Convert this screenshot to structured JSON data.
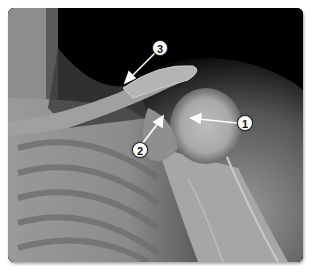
{
  "figure": {
    "colors": {
      "background": "#ffffff",
      "film_dark": "#000000",
      "bone_light": "#c8c8c8",
      "soft_tissue": "#8a8a8a",
      "callout_fill": "#ffffff",
      "callout_arrow": "#ffffff"
    },
    "callouts": [
      {
        "number": "1",
        "x": 245,
        "y": 123,
        "arrow_to": [
          192,
          118
        ]
      },
      {
        "number": "2",
        "x": 140,
        "y": 150,
        "arrow_to": [
          162,
          125
        ]
      },
      {
        "number": "3",
        "x": 160,
        "y": 48,
        "arrow_to": [
          128,
          80
        ]
      }
    ]
  }
}
